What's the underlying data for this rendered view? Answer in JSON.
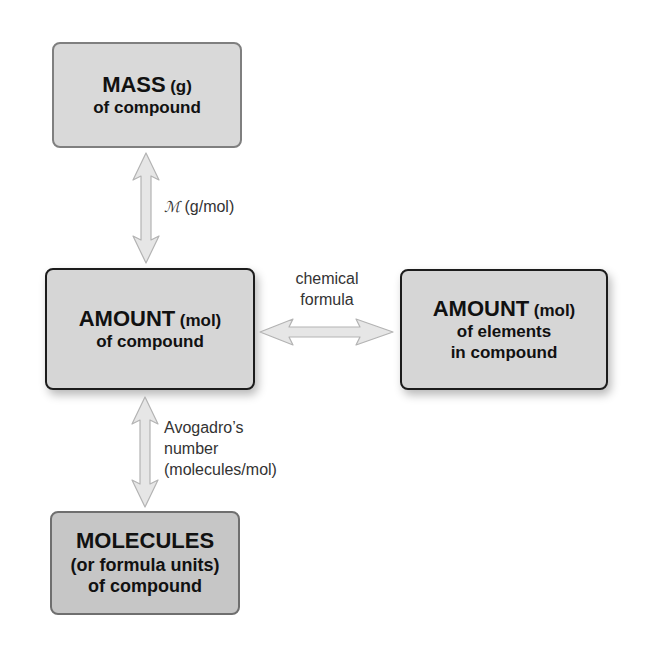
{
  "diagram": {
    "boxes": {
      "mass": {
        "title": "MASS",
        "unit": "(g)",
        "subtitle": "of compound"
      },
      "amount_compound": {
        "title": "AMOUNT",
        "unit": "(mol)",
        "subtitle": "of compound"
      },
      "amount_elements": {
        "title": "AMOUNT",
        "unit": "(mol)",
        "subtitle_line1": "of elements",
        "subtitle_line2": "in compound"
      },
      "molecules": {
        "title": "MOLECULES",
        "subtitle_line1": "(or formula units)",
        "subtitle_line2": "of compound"
      }
    },
    "connections": {
      "molar_mass": {
        "symbol": "ℳ",
        "text": "(g/mol)"
      },
      "chemical_formula": {
        "line1": "chemical",
        "line2": "formula"
      },
      "avogadro": {
        "line1": "Avogadro’s",
        "line2": "number",
        "line3": "(molecules/mol)"
      }
    },
    "colors": {
      "box_fill": "#d9d9d9",
      "molecules_fill": "#c6c6c6",
      "arrow_fill": "#e6e6e6",
      "arrow_stroke": "#b3b3b3"
    }
  }
}
